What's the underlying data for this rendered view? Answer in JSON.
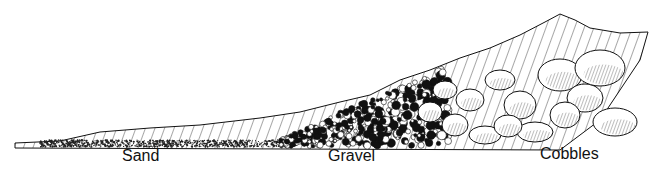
{
  "diagram": {
    "labels": {
      "sand": "Sand",
      "gravel": "Gravel",
      "cobbles": "Cobbles"
    }
  }
}
